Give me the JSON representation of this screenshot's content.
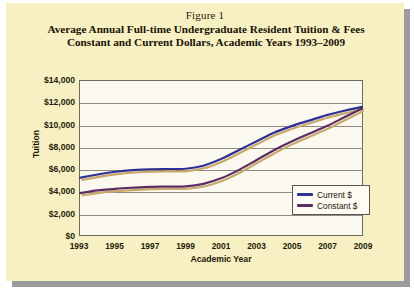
{
  "figure": {
    "label": "Figure 1",
    "title_line1": "Average Annual Full-time Undergraduate Resident Tuition & Fees",
    "title_line2": "Constant and Current Dollars, Academic Years 1993–2009"
  },
  "colors": {
    "page_background": "#f7f0c2",
    "plot_background": "#fbf8ef",
    "shadow": "#9c9c9c",
    "axis": "#6f6a5e",
    "gridline": "#8d8a80",
    "current": "#2e3192",
    "constant": "#5b2d63",
    "series_shadow": "#c8a96b",
    "text": "#1d1608"
  },
  "chart_data": {
    "type": "line",
    "title": "Average Annual Full-time Undergraduate Resident Tuition & Fees Constant and Current Dollars, Academic Years 1993–2009",
    "xlabel": "Academic Year",
    "ylabel": "Tuition",
    "grid": true,
    "legend_position": "inside-right",
    "xlim": [
      1993,
      2009
    ],
    "ylim": [
      0,
      14000
    ],
    "yticks": [
      0,
      2000,
      4000,
      6000,
      8000,
      10000,
      12000,
      14000
    ],
    "ytick_labels": [
      "$0",
      "$2,000",
      "$4,000",
      "$6,000",
      "$8,000",
      "$10,000",
      "$12,000",
      "$14,000"
    ],
    "xticks": [
      1993,
      1995,
      1997,
      1999,
      2001,
      2003,
      2005,
      2007,
      2009
    ],
    "xtick_labels": [
      "1993",
      "1995",
      "1997",
      "1999",
      "2001",
      "2003",
      "2005",
      "2007",
      "2009"
    ],
    "x": [
      1993,
      1994,
      1995,
      1996,
      1997,
      1998,
      1999,
      2000,
      2001,
      2002,
      2003,
      2004,
      2005,
      2006,
      2007,
      2008,
      2009
    ],
    "series": [
      {
        "name": "Current $",
        "color": "#2e3192",
        "values": [
          5200,
          5500,
          5750,
          5900,
          5980,
          6000,
          6020,
          6300,
          6900,
          7700,
          8500,
          9300,
          9900,
          10400,
          10900,
          11300,
          11650
        ]
      },
      {
        "name": "Constant $",
        "color": "#5b2d63",
        "values": [
          3800,
          4050,
          4200,
          4300,
          4380,
          4400,
          4420,
          4650,
          5150,
          5900,
          6800,
          7700,
          8500,
          9200,
          9900,
          10700,
          11500
        ]
      }
    ]
  },
  "legend": {
    "items": [
      {
        "label": "Current $",
        "color": "#2e3192"
      },
      {
        "label": "Constant $",
        "color": "#5b2d63"
      }
    ]
  }
}
